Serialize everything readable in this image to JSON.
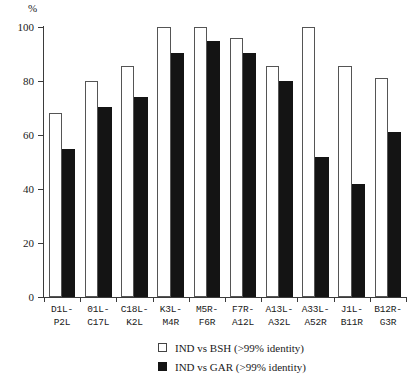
{
  "chart_data": {
    "type": "bar",
    "title": "",
    "xlabel": "",
    "ylabel": "%",
    "ylim": [
      0,
      100
    ],
    "yticks": [
      0,
      20,
      40,
      60,
      80,
      100
    ],
    "ytick_labels": [
      "0",
      "20",
      "40",
      "60",
      "80",
      "100"
    ],
    "grid": false,
    "legend_position": "bottom-center",
    "categories": [
      "D1L-P2L",
      "01L-C17L",
      "C18L-K2L",
      "K3L-M4R",
      "M5R-F6R",
      "F7R-A12L",
      "A13L-A32L",
      "A33L-A52R",
      "J1L-B11R",
      "B12R-G3R"
    ],
    "category_lines": [
      [
        "D1L-",
        "P2L"
      ],
      [
        "01L-",
        "C17L"
      ],
      [
        "C18L-",
        "K2L"
      ],
      [
        "K3L-",
        "M4R"
      ],
      [
        "M5R-",
        "F6R"
      ],
      [
        "F7R-",
        "A12L"
      ],
      [
        "A13L-",
        "A32L"
      ],
      [
        "A33L-",
        "A52R"
      ],
      [
        "J1L-",
        "B11R"
      ],
      [
        "B12R-",
        "G3R"
      ]
    ],
    "series": [
      {
        "name": "IND vs BSH (>99% identity)",
        "color": "#ffffff",
        "edge_color": "#555555",
        "values": [
          68,
          80,
          85.5,
          100,
          100,
          96,
          85.5,
          100,
          85.5,
          81
        ]
      },
      {
        "name": "IND vs GAR (>99% identity)",
        "color": "#141414",
        "edge_color": "#141414",
        "values": [
          55,
          70.5,
          74,
          90.5,
          95,
          90.5,
          80,
          52,
          42,
          61
        ]
      }
    ]
  },
  "legend": {
    "items": [
      {
        "label": "IND vs BSH (>99% identity)",
        "swatch": "open-square-swatch"
      },
      {
        "label": "IND vs GAR (>99% identity)",
        "swatch": "filled-square-swatch"
      }
    ]
  },
  "axis": {
    "unit_label": "%"
  }
}
